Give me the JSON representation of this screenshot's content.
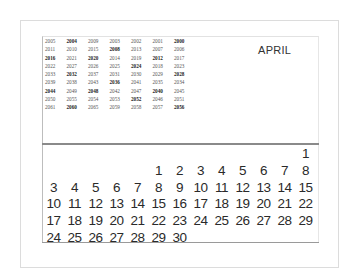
{
  "calendar": {
    "month": "APRIL",
    "year_table": [
      [
        {
          "y": "2005",
          "leap": false
        },
        {
          "y": "2004",
          "leap": true
        },
        {
          "y": "2009",
          "leap": false
        },
        {
          "y": "2003",
          "leap": false
        },
        {
          "y": "2002",
          "leap": false
        },
        {
          "y": "2001",
          "leap": false
        },
        {
          "y": "2000",
          "leap": true
        }
      ],
      [
        {
          "y": "2011",
          "leap": false
        },
        {
          "y": "2010",
          "leap": false
        },
        {
          "y": "2015",
          "leap": false
        },
        {
          "y": "2008",
          "leap": true
        },
        {
          "y": "2013",
          "leap": false
        },
        {
          "y": "2007",
          "leap": false
        },
        {
          "y": "2006",
          "leap": false
        }
      ],
      [
        {
          "y": "2016",
          "leap": true
        },
        {
          "y": "2021",
          "leap": false
        },
        {
          "y": "2020",
          "leap": true
        },
        {
          "y": "2014",
          "leap": false
        },
        {
          "y": "2019",
          "leap": false
        },
        {
          "y": "2012",
          "leap": true
        },
        {
          "y": "2017",
          "leap": false
        }
      ],
      [
        {
          "y": "2022",
          "leap": false
        },
        {
          "y": "2027",
          "leap": false
        },
        {
          "y": "2026",
          "leap": false
        },
        {
          "y": "2025",
          "leap": false
        },
        {
          "y": "2024",
          "leap": true
        },
        {
          "y": "2018",
          "leap": false
        },
        {
          "y": "2023",
          "leap": false
        }
      ],
      [
        {
          "y": "2033",
          "leap": false
        },
        {
          "y": "2032",
          "leap": true
        },
        {
          "y": "2037",
          "leap": false
        },
        {
          "y": "2031",
          "leap": false
        },
        {
          "y": "2030",
          "leap": false
        },
        {
          "y": "2029",
          "leap": false
        },
        {
          "y": "2028",
          "leap": true
        }
      ],
      [
        {
          "y": "2039",
          "leap": false
        },
        {
          "y": "2038",
          "leap": false
        },
        {
          "y": "2043",
          "leap": false
        },
        {
          "y": "2036",
          "leap": true
        },
        {
          "y": "2041",
          "leap": false
        },
        {
          "y": "2035",
          "leap": false
        },
        {
          "y": "2034",
          "leap": false
        }
      ],
      [
        {
          "y": "2044",
          "leap": true
        },
        {
          "y": "2049",
          "leap": false
        },
        {
          "y": "2048",
          "leap": true
        },
        {
          "y": "2042",
          "leap": false
        },
        {
          "y": "2047",
          "leap": false
        },
        {
          "y": "2040",
          "leap": true
        },
        {
          "y": "2045",
          "leap": false
        }
      ],
      [
        {
          "y": "2050",
          "leap": false
        },
        {
          "y": "2055",
          "leap": false
        },
        {
          "y": "2054",
          "leap": false
        },
        {
          "y": "2053",
          "leap": false
        },
        {
          "y": "2052",
          "leap": true
        },
        {
          "y": "2046",
          "leap": false
        },
        {
          "y": "2051",
          "leap": false
        }
      ],
      [
        {
          "y": "2061",
          "leap": false
        },
        {
          "y": "2060",
          "leap": true
        },
        {
          "y": "2065",
          "leap": false
        },
        {
          "y": "2059",
          "leap": false
        },
        {
          "y": "2058",
          "leap": false
        },
        {
          "y": "2057",
          "leap": false
        },
        {
          "y": "2056",
          "leap": true
        }
      ]
    ],
    "day_rows": [
      [
        "",
        "",
        "",
        "",
        "",
        "",
        "",
        "",
        "",
        "",
        "",
        "",
        "1"
      ],
      [
        "",
        "",
        "",
        "",
        "",
        "1",
        "2",
        "3",
        "4",
        "5",
        "6",
        "7",
        "8"
      ],
      [
        "3",
        "4",
        "5",
        "6",
        "7",
        "8",
        "9",
        "10",
        "11",
        "12",
        "13",
        "14",
        "15"
      ],
      [
        "10",
        "11",
        "12",
        "13",
        "14",
        "15",
        "16",
        "17",
        "18",
        "19",
        "20",
        "21",
        "22"
      ],
      [
        "17",
        "18",
        "19",
        "20",
        "21",
        "22",
        "23",
        "24",
        "25",
        "26",
        "27",
        "28",
        "29"
      ],
      [
        "24",
        "25",
        "26",
        "27",
        "28",
        "29",
        "30",
        "",
        "",
        "",
        "",
        "",
        ""
      ]
    ]
  }
}
